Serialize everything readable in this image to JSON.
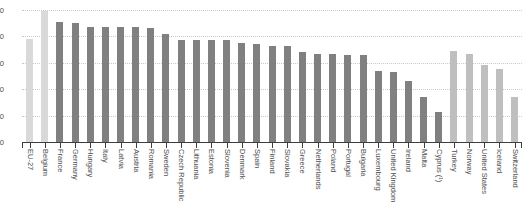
{
  "chart_data": {
    "type": "bar",
    "title": "",
    "subtitle": "",
    "xlabel": "",
    "ylabel": "",
    "ylim": [
      0,
      50
    ],
    "grid": true,
    "legend": "none",
    "y_ticks": [
      50,
      40,
      30,
      20,
      10,
      0
    ],
    "categories": [
      "EU-27",
      "Belgium",
      "France",
      "Germany",
      "Hungary",
      "Italy",
      "Latvia",
      "Austria",
      "Romania",
      "Sweden",
      "Czech Republic",
      "Lithuania",
      "Estonia",
      "Slovenia",
      "Denmark",
      "Spain",
      "Finland",
      "Slovakia",
      "Greece",
      "Netherlands",
      "Poland",
      "Portugal",
      "Bulgaria",
      "Luxembourg",
      "United Kingdom",
      "Ireland",
      "Malta",
      "Cyprus (¹)",
      "Turkey",
      "Norway",
      "United States",
      "Iceland",
      "Switzerland"
    ],
    "values": [
      39.0,
      49.5,
      45.5,
      45.0,
      43.5,
      43.5,
      43.5,
      43.5,
      43.0,
      41.0,
      38.5,
      38.5,
      38.5,
      38.5,
      37.5,
      37.0,
      36.5,
      36.5,
      34.0,
      33.5,
      33.5,
      33.0,
      33.0,
      27.0,
      26.5,
      23.0,
      17.0,
      11.5,
      34.5,
      33.5,
      29.0,
      27.5,
      17.0
    ],
    "bar_colors": [
      "#d9d9d9",
      "#d9d9d9",
      "#808080",
      "#808080",
      "#808080",
      "#808080",
      "#808080",
      "#808080",
      "#808080",
      "#808080",
      "#808080",
      "#808080",
      "#808080",
      "#808080",
      "#808080",
      "#808080",
      "#808080",
      "#808080",
      "#808080",
      "#808080",
      "#808080",
      "#808080",
      "#808080",
      "#808080",
      "#808080",
      "#808080",
      "#808080",
      "#808080",
      "#bfbfbf",
      "#bfbfbf",
      "#bfbfbf",
      "#bfbfbf",
      "#bfbfbf"
    ]
  },
  "style": {
    "aggregate_color": "#d9d9d9",
    "member_color": "#808080",
    "non_member_color": "#bfbfbf",
    "axis_color": "#3d3d3d",
    "grid_color": "#c9c9c9",
    "text_color": "#4d4d4d",
    "background": "#ffffff"
  }
}
